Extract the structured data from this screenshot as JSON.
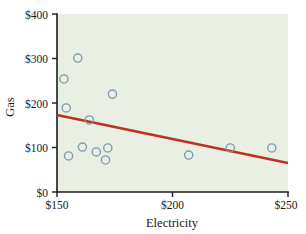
{
  "chart_data": {
    "type": "scatter",
    "title": "",
    "xlabel": "Electricity",
    "ylabel": "Gas",
    "xlim": [
      150,
      250
    ],
    "ylim": [
      0,
      400
    ],
    "grid": false,
    "legend": null,
    "x_tick_labels": [
      "$150",
      "$200",
      "$250"
    ],
    "x_tick_values": [
      150,
      200,
      250
    ],
    "y_tick_labels": [
      "$0",
      "$100",
      "$200",
      "$300",
      "$400"
    ],
    "y_tick_values": [
      0,
      100,
      200,
      300,
      400
    ],
    "x": [
      153,
      154,
      155,
      159,
      161,
      164,
      167,
      171,
      172,
      174,
      207,
      225,
      243
    ],
    "y": [
      254,
      189,
      81,
      301,
      101,
      162,
      90,
      72,
      99,
      220,
      83,
      99,
      99
    ],
    "points": [
      {
        "x": 153,
        "y": 254
      },
      {
        "x": 154,
        "y": 189
      },
      {
        "x": 155,
        "y": 81
      },
      {
        "x": 159,
        "y": 301
      },
      {
        "x": 161,
        "y": 101
      },
      {
        "x": 164,
        "y": 162
      },
      {
        "x": 167,
        "y": 90
      },
      {
        "x": 171,
        "y": 72
      },
      {
        "x": 172,
        "y": 99
      },
      {
        "x": 174,
        "y": 220
      },
      {
        "x": 207,
        "y": 83
      },
      {
        "x": 225,
        "y": 99
      },
      {
        "x": 243,
        "y": 99
      }
    ],
    "series": [
      {
        "name": "Gas vs Electricity",
        "marker": "open-circle",
        "color": "#7d9bb2",
        "values": [
          254,
          189,
          81,
          301,
          101,
          162,
          90,
          72,
          99,
          220,
          83,
          99,
          99
        ]
      }
    ],
    "trendline": {
      "type": "linear",
      "color": "#bf3024",
      "x_start": 150,
      "y_start": 173,
      "x_end": 250,
      "y_end": 65
    },
    "colors": {
      "plot_background": "#e9efe3",
      "marker_stroke": "#7d9bb2",
      "trendline": "#bf3024",
      "axis": "#1c1c1c",
      "text": "#1a1a1a",
      "page_background": "#ffffff"
    }
  }
}
